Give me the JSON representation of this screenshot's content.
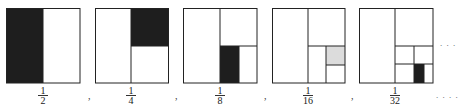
{
  "figure": {
    "colors": {
      "stroke": "#222222",
      "dark_fill": "#1e1e1e",
      "light_fill": "#dcdcdc",
      "background": "#ffffff"
    },
    "items": [
      {
        "label_num": "1",
        "label_den": "2",
        "shaded": "dark"
      },
      {
        "label_num": "1",
        "label_den": "4",
        "shaded": "dark"
      },
      {
        "label_num": "1",
        "label_den": "8",
        "shaded": "dark"
      },
      {
        "label_num": "1",
        "label_den": "16",
        "shaded": "light"
      },
      {
        "label_num": "1",
        "label_den": "32",
        "shaded": "dark"
      }
    ],
    "separator": ",",
    "ellipsis_top": ". . .",
    "ellipsis_bottom": ". . . ."
  }
}
